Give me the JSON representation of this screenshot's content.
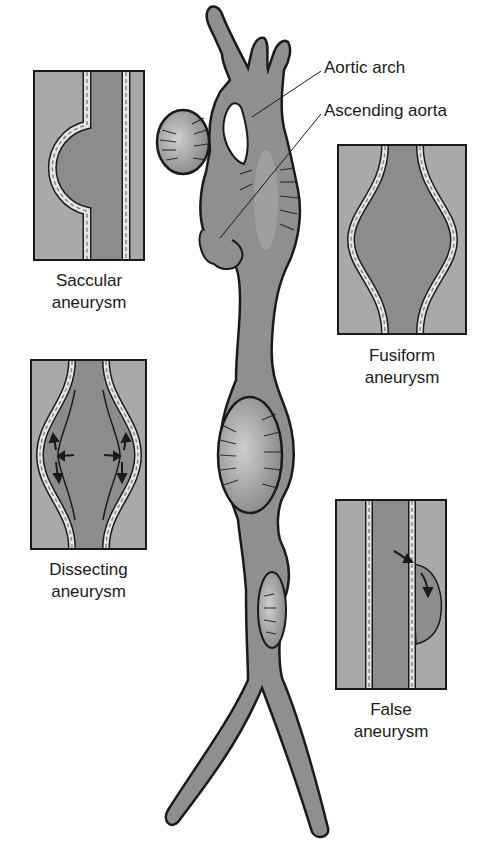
{
  "colors": {
    "outer_tissue": "#a9a9a9",
    "lumen": "#8c8c8c",
    "aorta_fill": "#8f8f8f",
    "outline": "#1a1a1a",
    "wall_light": "#e6e6e6",
    "highlight": "#c8c8c8"
  },
  "callouts": {
    "aortic_arch": "Aortic arch",
    "ascending_aorta": "Ascending aorta"
  },
  "panels": [
    {
      "id": "saccular",
      "line1": "Saccular",
      "line2": "aneurysm"
    },
    {
      "id": "fusiform",
      "line1": "Fusiform",
      "line2": "aneurysm"
    },
    {
      "id": "dissecting",
      "line1": "Dissecting",
      "line2": "aneurysm"
    },
    {
      "id": "false",
      "line1": "False",
      "line2": "aneurysm"
    }
  ]
}
